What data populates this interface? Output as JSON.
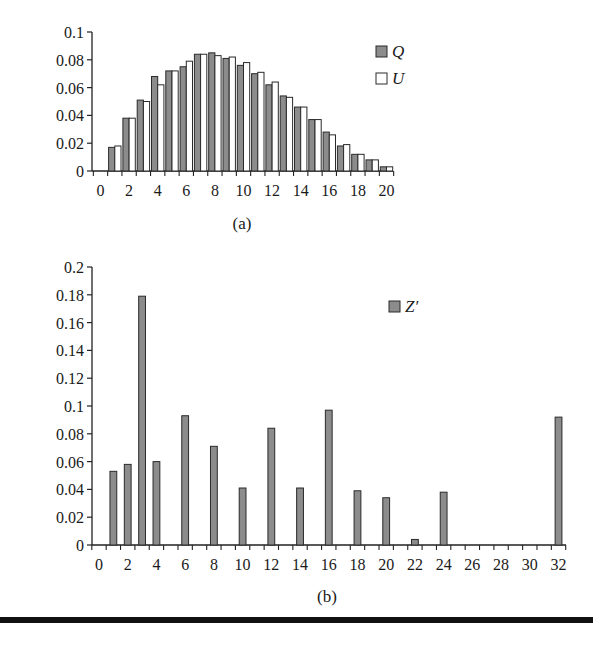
{
  "figure": {
    "caption_a": "(a)",
    "caption_b": "(b)"
  },
  "colors": {
    "filled_bar": "#8c8c8c",
    "open_bar": "#ffffff",
    "bar_stroke": "#2a2a2a",
    "axis": "#222222",
    "rule": "#111111"
  },
  "chart_data": [
    {
      "id": "a",
      "type": "bar",
      "title": "",
      "caption": "(a)",
      "xlabel": "",
      "ylabel": "",
      "categories": [
        0,
        1,
        2,
        3,
        4,
        5,
        6,
        7,
        8,
        9,
        10,
        11,
        12,
        13,
        14,
        15,
        16,
        17,
        18,
        19,
        20
      ],
      "x_tick_labels": [
        "0",
        "2",
        "4",
        "6",
        "8",
        "10",
        "12",
        "14",
        "16",
        "18",
        "20"
      ],
      "y_tick_labels": [
        "0",
        "0.02",
        "0.04",
        "0.06",
        "0.08",
        "0.1"
      ],
      "ylim": [
        0,
        0.1
      ],
      "grid": false,
      "legend_position": "right-top",
      "series": [
        {
          "name": "Q",
          "style": "filled",
          "values": [
            0,
            0.017,
            0.038,
            0.051,
            0.068,
            0.072,
            0.075,
            0.084,
            0.085,
            0.081,
            0.076,
            0.07,
            0.062,
            0.054,
            0.046,
            0.037,
            0.028,
            0.018,
            0.012,
            0.008,
            0.003
          ]
        },
        {
          "name": "U",
          "style": "open",
          "values": [
            0,
            0.018,
            0.038,
            0.05,
            0.062,
            0.072,
            0.079,
            0.084,
            0.083,
            0.082,
            0.078,
            0.071,
            0.064,
            0.053,
            0.046,
            0.037,
            0.026,
            0.019,
            0.012,
            0.008,
            0.003
          ]
        }
      ]
    },
    {
      "id": "b",
      "type": "bar",
      "title": "",
      "caption": "(b)",
      "xlabel": "",
      "ylabel": "",
      "categories": [
        0,
        1,
        2,
        3,
        4,
        5,
        6,
        7,
        8,
        9,
        10,
        11,
        12,
        13,
        14,
        15,
        16,
        17,
        18,
        19,
        20,
        21,
        22,
        23,
        24,
        25,
        26,
        27,
        28,
        29,
        30,
        31,
        32
      ],
      "x_tick_labels": [
        "0",
        "2",
        "4",
        "6",
        "8",
        "10",
        "12",
        "14",
        "16",
        "18",
        "20",
        "22",
        "24",
        "26",
        "28",
        "30",
        "32"
      ],
      "y_tick_labels": [
        "0",
        "0.02",
        "0.04",
        "0.06",
        "0.08",
        "0.1",
        "0.12",
        "0.14",
        "0.16",
        "0.18",
        "0.2"
      ],
      "ylim": [
        0,
        0.2
      ],
      "grid": false,
      "legend_position": "right-top",
      "series": [
        {
          "name": "Z′",
          "style": "filled",
          "values": [
            0,
            0.053,
            0.058,
            0.179,
            0.06,
            0,
            0.093,
            0,
            0.071,
            0,
            0.041,
            0,
            0.084,
            0,
            0.041,
            0,
            0.097,
            0,
            0.039,
            0,
            0.034,
            0,
            0.004,
            0,
            0.038,
            0,
            0,
            0,
            0,
            0,
            0,
            0,
            0.092
          ]
        }
      ]
    }
  ]
}
